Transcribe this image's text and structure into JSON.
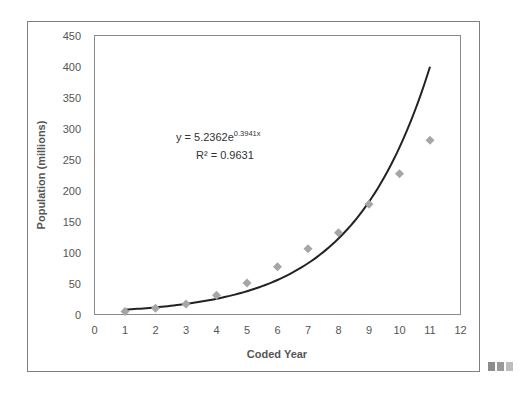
{
  "chart_data": {
    "type": "scatter",
    "title": "",
    "xlabel": "Coded Year",
    "ylabel": "Population (millions)",
    "xlim": [
      0,
      12
    ],
    "ylim": [
      0,
      450
    ],
    "x_ticks": [
      0,
      1,
      2,
      3,
      4,
      5,
      6,
      7,
      8,
      9,
      10,
      11,
      12
    ],
    "y_ticks": [
      0,
      50,
      100,
      150,
      200,
      250,
      300,
      350,
      400,
      450
    ],
    "grid": false,
    "legend": null,
    "series": [
      {
        "name": "Population",
        "marker": "diamond",
        "color": "#a6a6a6",
        "x": [
          1,
          2,
          3,
          4,
          5,
          6,
          7,
          8,
          9,
          10,
          11
        ],
        "y": [
          5,
          10,
          17,
          31,
          51,
          77,
          106,
          132,
          178,
          227,
          281
        ]
      }
    ],
    "trendline": {
      "type": "exponential",
      "color": "#222222",
      "a": 5.2362,
      "b": 0.3941,
      "x_range": [
        1,
        11
      ],
      "equation_label": "y = 5.2362e",
      "equation_exponent": "0.3941x",
      "r_squared_label": "R² = 0.9631"
    }
  },
  "ui": {
    "more_icon_colors": [
      "#8c8c8c",
      "#9a9a9a",
      "#bdbdbd"
    ]
  }
}
